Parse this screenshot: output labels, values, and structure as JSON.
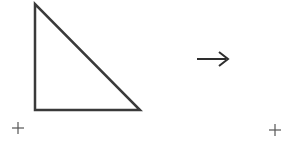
{
  "diagram": {
    "stroke_color": "#3a3a3a",
    "triangle": {
      "points": [
        [
          35,
          4
        ],
        [
          35,
          110
        ],
        [
          140,
          110
        ]
      ],
      "stroke_width": 2.5
    },
    "arrow": {
      "x1": 197,
      "y1": 59,
      "x2": 227,
      "y2": 59,
      "glyph": "→"
    },
    "markers": [
      {
        "symbol": "+",
        "x": 18,
        "y": 128
      },
      {
        "symbol": "+",
        "x": 275,
        "y": 130
      }
    ]
  }
}
